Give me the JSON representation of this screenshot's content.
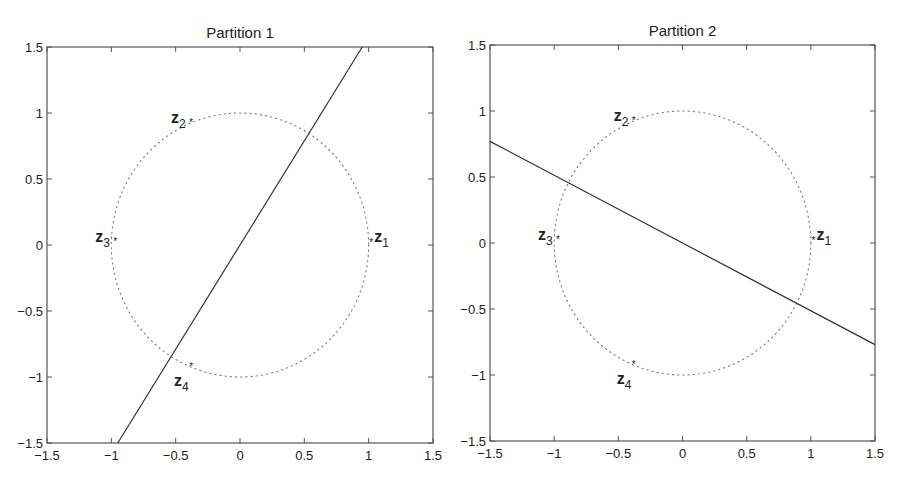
{
  "chart_data": [
    {
      "type": "scatter",
      "title": "Partition 1",
      "xlabel": "",
      "ylabel": "",
      "xlim": [
        -1.5,
        1.5
      ],
      "ylim": [
        -1.5,
        1.5
      ],
      "xticks": [
        -1.5,
        -1,
        -0.5,
        0,
        0.5,
        1,
        1.5
      ],
      "yticks": [
        -1.5,
        -1,
        -0.5,
        0,
        0.5,
        1,
        1.5
      ],
      "xtick_labels": [
        "−1.5",
        "−1",
        "−0.5",
        "0",
        "0.5",
        "1",
        "1.5"
      ],
      "ytick_labels": [
        "−1.5",
        "−1",
        "−0.5",
        "0",
        "0.5",
        "1",
        "1.5"
      ],
      "grid": false,
      "circle": {
        "center": [
          0,
          0
        ],
        "radius": 1,
        "style": "dotted"
      },
      "points": [
        {
          "label": "z",
          "sub": "1",
          "x": 1.02,
          "y": 0.02,
          "label_pos": "right-above"
        },
        {
          "label": "z",
          "sub": "2",
          "x": -0.38,
          "y": 0.93,
          "label_pos": "left"
        },
        {
          "label": "z",
          "sub": "3",
          "x": -0.97,
          "y": 0.03,
          "label_pos": "left"
        },
        {
          "label": "z",
          "sub": "4",
          "x": -0.38,
          "y": -0.92,
          "label_pos": "below-left"
        }
      ],
      "line": {
        "x": [
          -0.95,
          0.95
        ],
        "y": [
          -1.5,
          1.5
        ],
        "style": "solid"
      }
    },
    {
      "type": "scatter",
      "title": "Partition 2",
      "xlabel": "",
      "ylabel": "",
      "xlim": [
        -1.5,
        1.5
      ],
      "ylim": [
        -1.5,
        1.5
      ],
      "xticks": [
        -1.5,
        -1,
        -0.5,
        0,
        0.5,
        1,
        1.5
      ],
      "yticks": [
        -1.5,
        -1,
        -0.5,
        0,
        0.5,
        1,
        1.5
      ],
      "xtick_labels": [
        "−1.5",
        "−1",
        "−0.5",
        "0",
        "0.5",
        "1",
        "1.5"
      ],
      "ytick_labels": [
        "−1.5",
        "−1",
        "−0.5",
        "0",
        "0.5",
        "1",
        "1.5"
      ],
      "grid": false,
      "circle": {
        "center": [
          0,
          0
        ],
        "radius": 1,
        "style": "dotted"
      },
      "points": [
        {
          "label": "z",
          "sub": "1",
          "x": 1.02,
          "y": 0.02,
          "label_pos": "right-above"
        },
        {
          "label": "z",
          "sub": "2",
          "x": -0.38,
          "y": 0.93,
          "label_pos": "left"
        },
        {
          "label": "z",
          "sub": "3",
          "x": -0.97,
          "y": 0.03,
          "label_pos": "left"
        },
        {
          "label": "z",
          "sub": "4",
          "x": -0.38,
          "y": -0.92,
          "label_pos": "below-left"
        }
      ],
      "line": {
        "x": [
          -1.5,
          1.5
        ],
        "y": [
          0.77,
          -0.77
        ],
        "style": "solid"
      }
    }
  ],
  "colors": {
    "axes": "#555555",
    "line": "#333333",
    "circle": "#777777",
    "text": "#222222"
  }
}
